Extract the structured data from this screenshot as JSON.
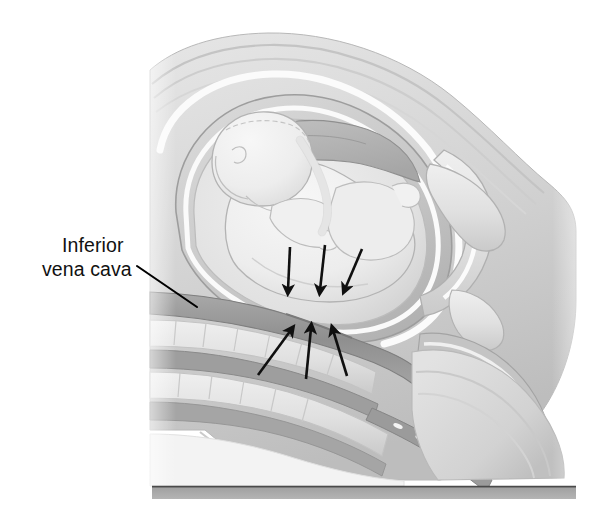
{
  "figure": {
    "type": "medical-illustration",
    "view": "sagittal cross-section",
    "color_mode": "grayscale",
    "width": 608,
    "height": 528,
    "background_color": "#ffffff"
  },
  "labels": {
    "ivc": {
      "line1": "Inferior",
      "line2": "vena cava",
      "x": 42,
      "y": 246,
      "line_height": 24,
      "font_size": 19.5,
      "color": "#111111",
      "leader_line": {
        "x1": 137,
        "y1": 266,
        "x2": 197,
        "y2": 307,
        "color": "#000000",
        "width": 2.1
      }
    }
  },
  "annotations": {
    "downward_arrows": {
      "name": "uterine-compression-arrows",
      "direction": "down",
      "count": 3,
      "color": "#101010",
      "stroke_width": 2.6,
      "arrows": [
        {
          "x1": 290,
          "y1": 247,
          "x2": 288,
          "y2": 290
        },
        {
          "x1": 325,
          "y1": 245,
          "x2": 320,
          "y2": 290
        },
        {
          "x1": 362,
          "y1": 249,
          "x2": 345,
          "y2": 289
        }
      ]
    },
    "upward_arrows": {
      "name": "vertebral-counterpressure-arrows",
      "direction": "up",
      "count": 3,
      "color": "#101010",
      "stroke_width": 2.6,
      "arrows": [
        {
          "x1": 258,
          "y1": 375,
          "x2": 291,
          "y2": 330
        },
        {
          "x1": 306,
          "y1": 379,
          "x2": 311,
          "y2": 328
        },
        {
          "x1": 347,
          "y1": 376,
          "x2": 333,
          "y2": 330
        }
      ]
    }
  },
  "anatomy": {
    "structures": [
      {
        "name": "abdominal-wall",
        "tone": "#d9d9d9"
      },
      {
        "name": "uterine-wall",
        "tone": "#c9c9c9"
      },
      {
        "name": "amniotic-cavity",
        "tone": "#e8e8e8"
      },
      {
        "name": "fetus",
        "tone": "#efefef"
      },
      {
        "name": "placenta",
        "tone": "#b4b4b4"
      },
      {
        "name": "umbilical-cord",
        "tone": "#f6f6f6"
      },
      {
        "name": "inferior-vena-cava",
        "tone": "#9a9a9a"
      },
      {
        "name": "aorta",
        "tone": "#9a9a9a"
      },
      {
        "name": "vertebral-column",
        "tone": "#e2e2e2"
      },
      {
        "name": "spinal-canal",
        "tone": "#9e9e9e"
      },
      {
        "name": "sacrum",
        "tone": "#dddddd"
      },
      {
        "name": "pubic-bone",
        "tone": "#e3e3e3"
      },
      {
        "name": "urinary-bladder",
        "tone": "#cfcfcf"
      },
      {
        "name": "rectum",
        "tone": "#c6c6c6"
      },
      {
        "name": "gluteal-soft-tissue",
        "tone": "#dcdcdc"
      },
      {
        "name": "support-surface",
        "tone": "#8e8e8e"
      }
    ]
  },
  "support_surface": {
    "name": "examination-table-surface",
    "x": 152,
    "y": 486,
    "width": 424,
    "height": 13,
    "top_line_color": "#4a4a4a",
    "fill_color": "#9b9b9b"
  }
}
